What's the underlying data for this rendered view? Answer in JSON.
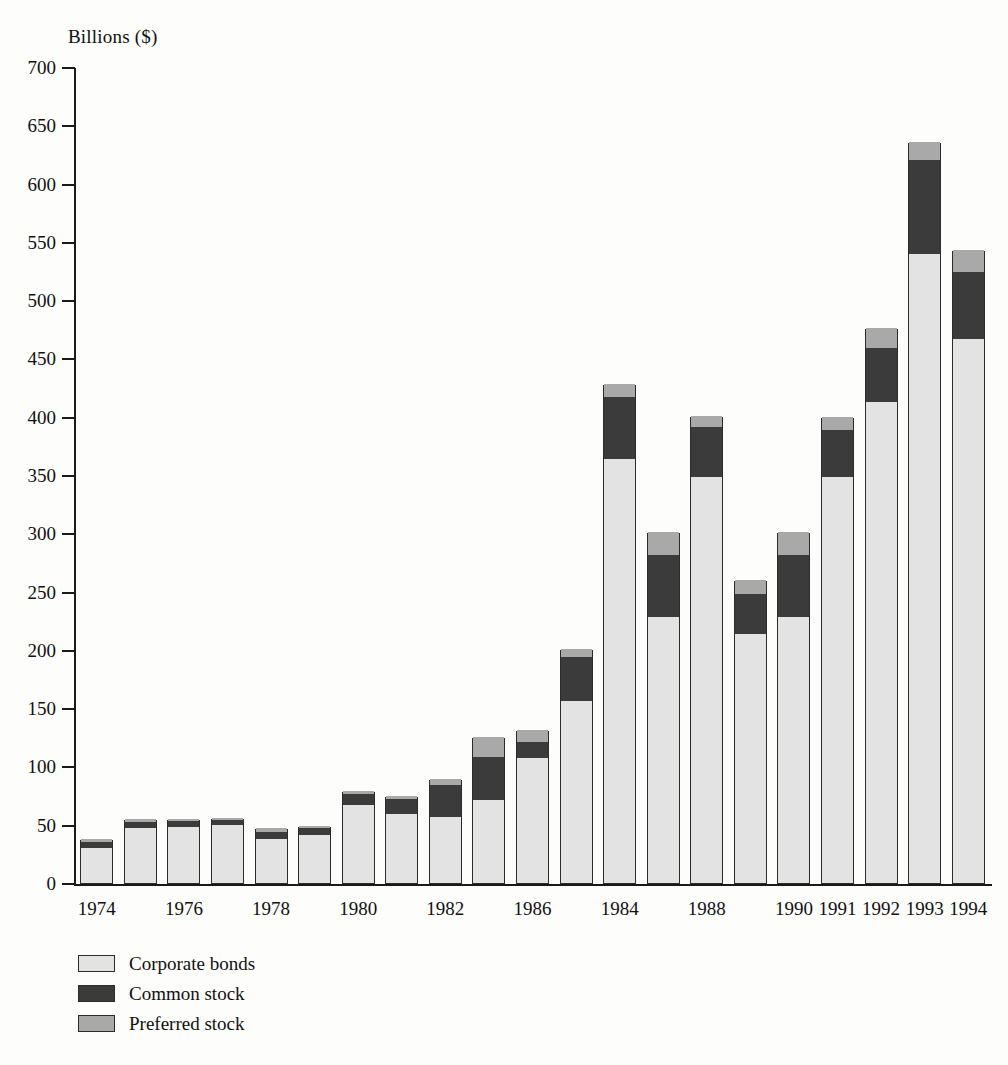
{
  "chart_data": {
    "type": "bar",
    "stacked": true,
    "title": "",
    "subtitle": "",
    "xlabel": "",
    "ylabel": "Billions ($)",
    "ylim": [
      0,
      700
    ],
    "ytick_step": 50,
    "yticks": [
      "700",
      "650",
      "600",
      "550",
      "500",
      "450",
      "400",
      "350",
      "300",
      "250",
      "200",
      "150",
      "100",
      "50",
      "0"
    ],
    "grid": false,
    "legend_position": "bottom-left",
    "categories": [
      "1974",
      "1975",
      "1976",
      "1977",
      "1978",
      "1979",
      "1980",
      "1981",
      "1982",
      "1983",
      "1986",
      "1985",
      "1984",
      "1987",
      "1988",
      "1989",
      "1990",
      "1991",
      "1992",
      "1993",
      "1994"
    ],
    "tick_labels": [
      "1974",
      "",
      "1976",
      "",
      "1978",
      "",
      "1980",
      "",
      "1982",
      "",
      "1986",
      "",
      "1984",
      "",
      "1988",
      "",
      "1990",
      "1991",
      "1992",
      "1993",
      "1994"
    ],
    "series": [
      {
        "name": "Corporate bonds",
        "color": "#e3e3e3",
        "values": [
          30,
          47,
          48,
          50,
          38,
          41,
          67,
          59,
          57,
          71,
          107,
          156,
          364,
          228,
          348,
          214,
          228,
          348,
          413,
          540,
          467
        ]
      },
      {
        "name": "Common stock",
        "color": "#3b3b3b",
        "values": [
          5,
          5,
          5,
          4,
          6,
          6,
          9,
          13,
          27,
          37,
          14,
          38,
          53,
          53,
          43,
          34,
          53,
          41,
          46,
          80,
          57
        ]
      },
      {
        "name": "Preferred stock",
        "color": "#a9a9a9",
        "values": [
          3,
          3,
          2,
          2,
          3,
          2,
          3,
          3,
          5,
          17,
          10,
          7,
          11,
          20,
          10,
          12,
          20,
          11,
          17,
          16,
          19
        ]
      }
    ],
    "totals": [
      38,
      55,
      55,
      56,
      47,
      49,
      79,
      75,
      89,
      125,
      131,
      201,
      428,
      301,
      401,
      260,
      301,
      400,
      476,
      636,
      543
    ]
  },
  "legend": {
    "items": [
      {
        "label": "Corporate bonds",
        "color": "#e3e3e3"
      },
      {
        "label": "Common stock",
        "color": "#3b3b3b"
      },
      {
        "label": "Preferred stock",
        "color": "#a9a9a9"
      }
    ]
  }
}
